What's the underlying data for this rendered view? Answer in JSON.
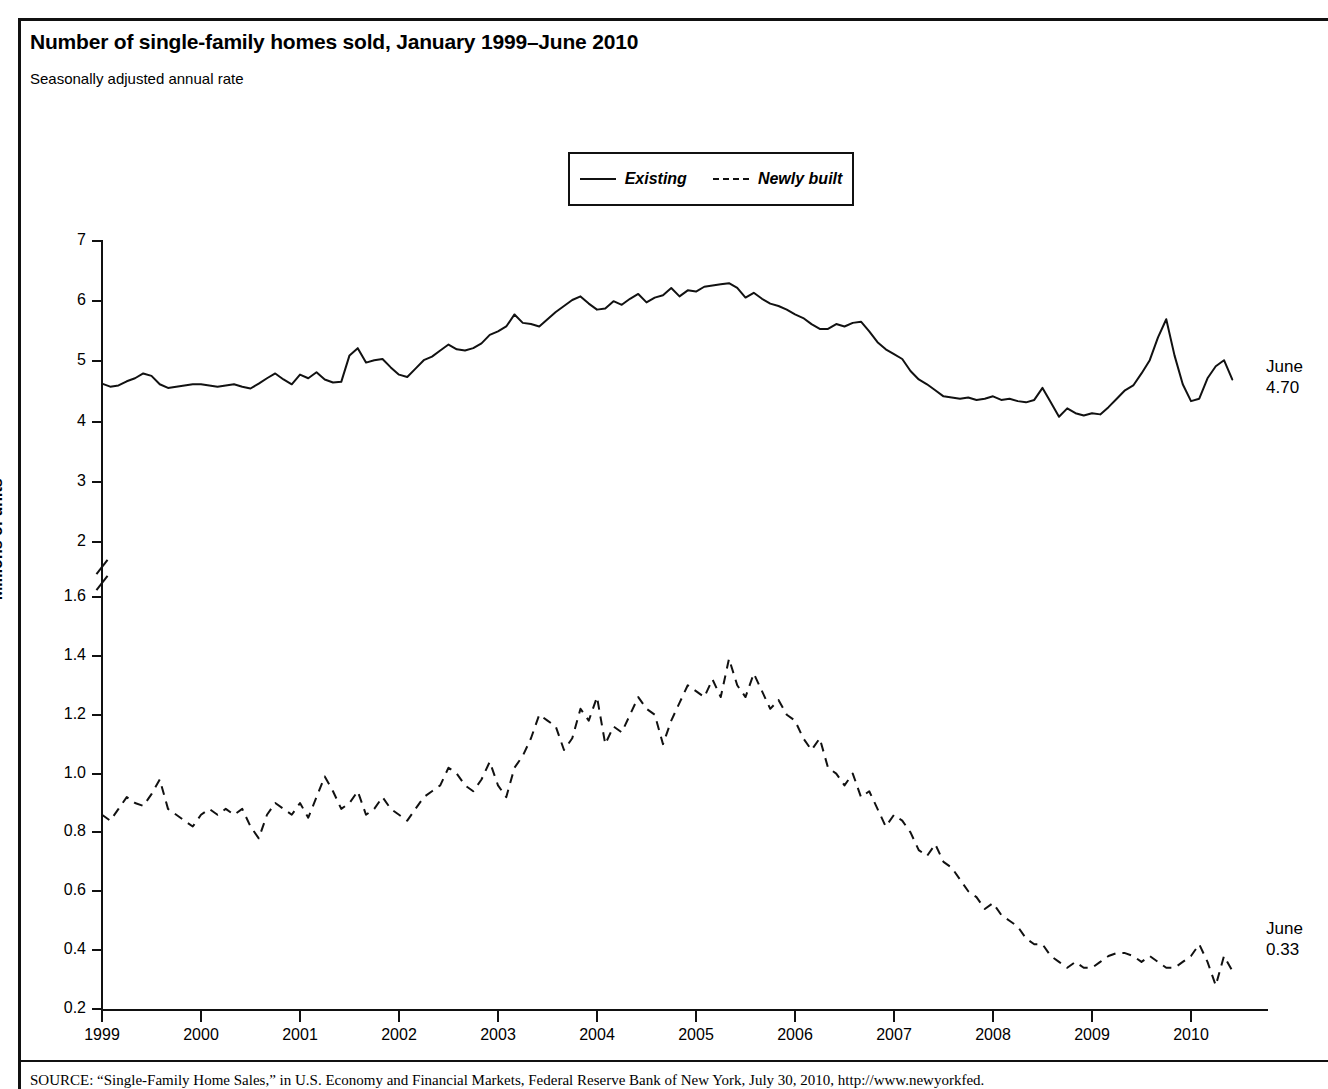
{
  "figure": {
    "title": "Number of single-family homes sold, January 1999–June 2010",
    "subtitle": "Seasonally adjusted annual rate",
    "source": "SOURCE: “Single-Family Home Sales,” in U.S. Economy and Financial Markets, Federal Reserve Bank of New York, July 30, 2010, http://www.newyorkfed."
  },
  "annotations": {
    "existing_label": "June",
    "existing_value": "4.70",
    "newly_label": "June",
    "newly_value": "0.33"
  },
  "chart_data": {
    "type": "line",
    "title": "Number of single-family homes sold, January 1999–June 2010",
    "subtitle": "Seasonally adjusted annual rate",
    "xlabel": "",
    "ylabel": "Millions of units",
    "grid": false,
    "legend_position": "top-center",
    "x_tick_labels": [
      "1999",
      "2000",
      "2001",
      "2002",
      "2003",
      "2004",
      "2005",
      "2006",
      "2007",
      "2008",
      "2009",
      "2010"
    ],
    "x_tick_values": [
      1999,
      2000,
      2001,
      2002,
      2003,
      2004,
      2005,
      2006,
      2007,
      2008,
      2009,
      2010
    ],
    "xlim": [
      1999.0,
      2010.75
    ],
    "y_tick_labels": [
      "7",
      "6",
      "5",
      "4",
      "3",
      "2",
      "1.6",
      "1.4",
      "1.2",
      "1.0",
      "0.8",
      "0.6",
      "0.4",
      "0.2"
    ],
    "y_tick_values": [
      7,
      6,
      5,
      4,
      3,
      2,
      1.6,
      1.4,
      1.2,
      1.0,
      0.8,
      0.6,
      0.4,
      0.2
    ],
    "axis_break": {
      "between": [
        2,
        1.6
      ],
      "note": "broken y-axis; upper segment 2–7, lower segment 0.2–1.6"
    },
    "series": [
      {
        "name": "Existing",
        "style": "solid",
        "units": "millions of units, SAAR",
        "end_label": "June 4.70",
        "start": "1999-01",
        "frequency": "monthly",
        "values": [
          4.63,
          4.58,
          4.6,
          4.67,
          4.72,
          4.8,
          4.76,
          4.62,
          4.56,
          4.58,
          4.6,
          4.62,
          4.62,
          4.6,
          4.58,
          4.6,
          4.62,
          4.58,
          4.55,
          4.63,
          4.72,
          4.8,
          4.7,
          4.62,
          4.78,
          4.72,
          4.82,
          4.7,
          4.65,
          4.66,
          5.1,
          5.22,
          4.98,
          5.02,
          5.04,
          4.9,
          4.78,
          4.74,
          4.88,
          5.02,
          5.08,
          5.18,
          5.28,
          5.2,
          5.18,
          5.22,
          5.3,
          5.44,
          5.5,
          5.58,
          5.78,
          5.64,
          5.62,
          5.58,
          5.7,
          5.82,
          5.92,
          6.02,
          6.08,
          5.96,
          5.86,
          5.88,
          6.0,
          5.94,
          6.04,
          6.12,
          5.98,
          6.06,
          6.1,
          6.22,
          6.08,
          6.18,
          6.16,
          6.24,
          6.26,
          6.28,
          6.3,
          6.22,
          6.06,
          6.14,
          6.04,
          5.96,
          5.92,
          5.86,
          5.78,
          5.72,
          5.62,
          5.54,
          5.54,
          5.62,
          5.58,
          5.64,
          5.66,
          5.5,
          5.32,
          5.2,
          5.12,
          5.04,
          4.84,
          4.7,
          4.62,
          4.52,
          4.42,
          4.4,
          4.38,
          4.4,
          4.36,
          4.38,
          4.42,
          4.36,
          4.38,
          4.34,
          4.32,
          4.36,
          4.56,
          4.32,
          4.08,
          4.22,
          4.14,
          4.1,
          4.14,
          4.12,
          4.24,
          4.38,
          4.52,
          4.6,
          4.8,
          5.02,
          5.4,
          5.7,
          5.1,
          4.62,
          4.34,
          4.38,
          4.72,
          4.92,
          5.02,
          4.7
        ]
      },
      {
        "name": "Newly built",
        "style": "dashed",
        "units": "millions of units, SAAR",
        "end_label": "June 0.33",
        "start": "1999-01",
        "frequency": "monthly",
        "values": [
          0.86,
          0.84,
          0.88,
          0.92,
          0.9,
          0.89,
          0.93,
          0.98,
          0.88,
          0.86,
          0.84,
          0.82,
          0.86,
          0.88,
          0.86,
          0.88,
          0.86,
          0.88,
          0.82,
          0.78,
          0.86,
          0.9,
          0.88,
          0.86,
          0.9,
          0.85,
          0.92,
          0.99,
          0.94,
          0.88,
          0.9,
          0.94,
          0.86,
          0.88,
          0.92,
          0.88,
          0.86,
          0.84,
          0.88,
          0.92,
          0.94,
          0.96,
          1.02,
          1.0,
          0.96,
          0.94,
          0.98,
          1.04,
          0.96,
          0.92,
          1.02,
          1.06,
          1.12,
          1.2,
          1.18,
          1.16,
          1.08,
          1.12,
          1.22,
          1.18,
          1.26,
          1.1,
          1.16,
          1.14,
          1.2,
          1.26,
          1.22,
          1.2,
          1.1,
          1.18,
          1.24,
          1.3,
          1.28,
          1.26,
          1.32,
          1.26,
          1.39,
          1.3,
          1.26,
          1.34,
          1.28,
          1.22,
          1.25,
          1.2,
          1.18,
          1.12,
          1.08,
          1.12,
          1.02,
          1.0,
          0.96,
          1.0,
          0.92,
          0.94,
          0.88,
          0.82,
          0.86,
          0.84,
          0.8,
          0.74,
          0.72,
          0.76,
          0.7,
          0.68,
          0.64,
          0.6,
          0.58,
          0.54,
          0.56,
          0.52,
          0.5,
          0.48,
          0.44,
          0.42,
          0.42,
          0.38,
          0.36,
          0.34,
          0.36,
          0.34,
          0.34,
          0.36,
          0.38,
          0.39,
          0.39,
          0.38,
          0.36,
          0.38,
          0.36,
          0.34,
          0.34,
          0.36,
          0.38,
          0.42,
          0.36,
          0.28,
          0.38,
          0.33
        ]
      }
    ]
  }
}
